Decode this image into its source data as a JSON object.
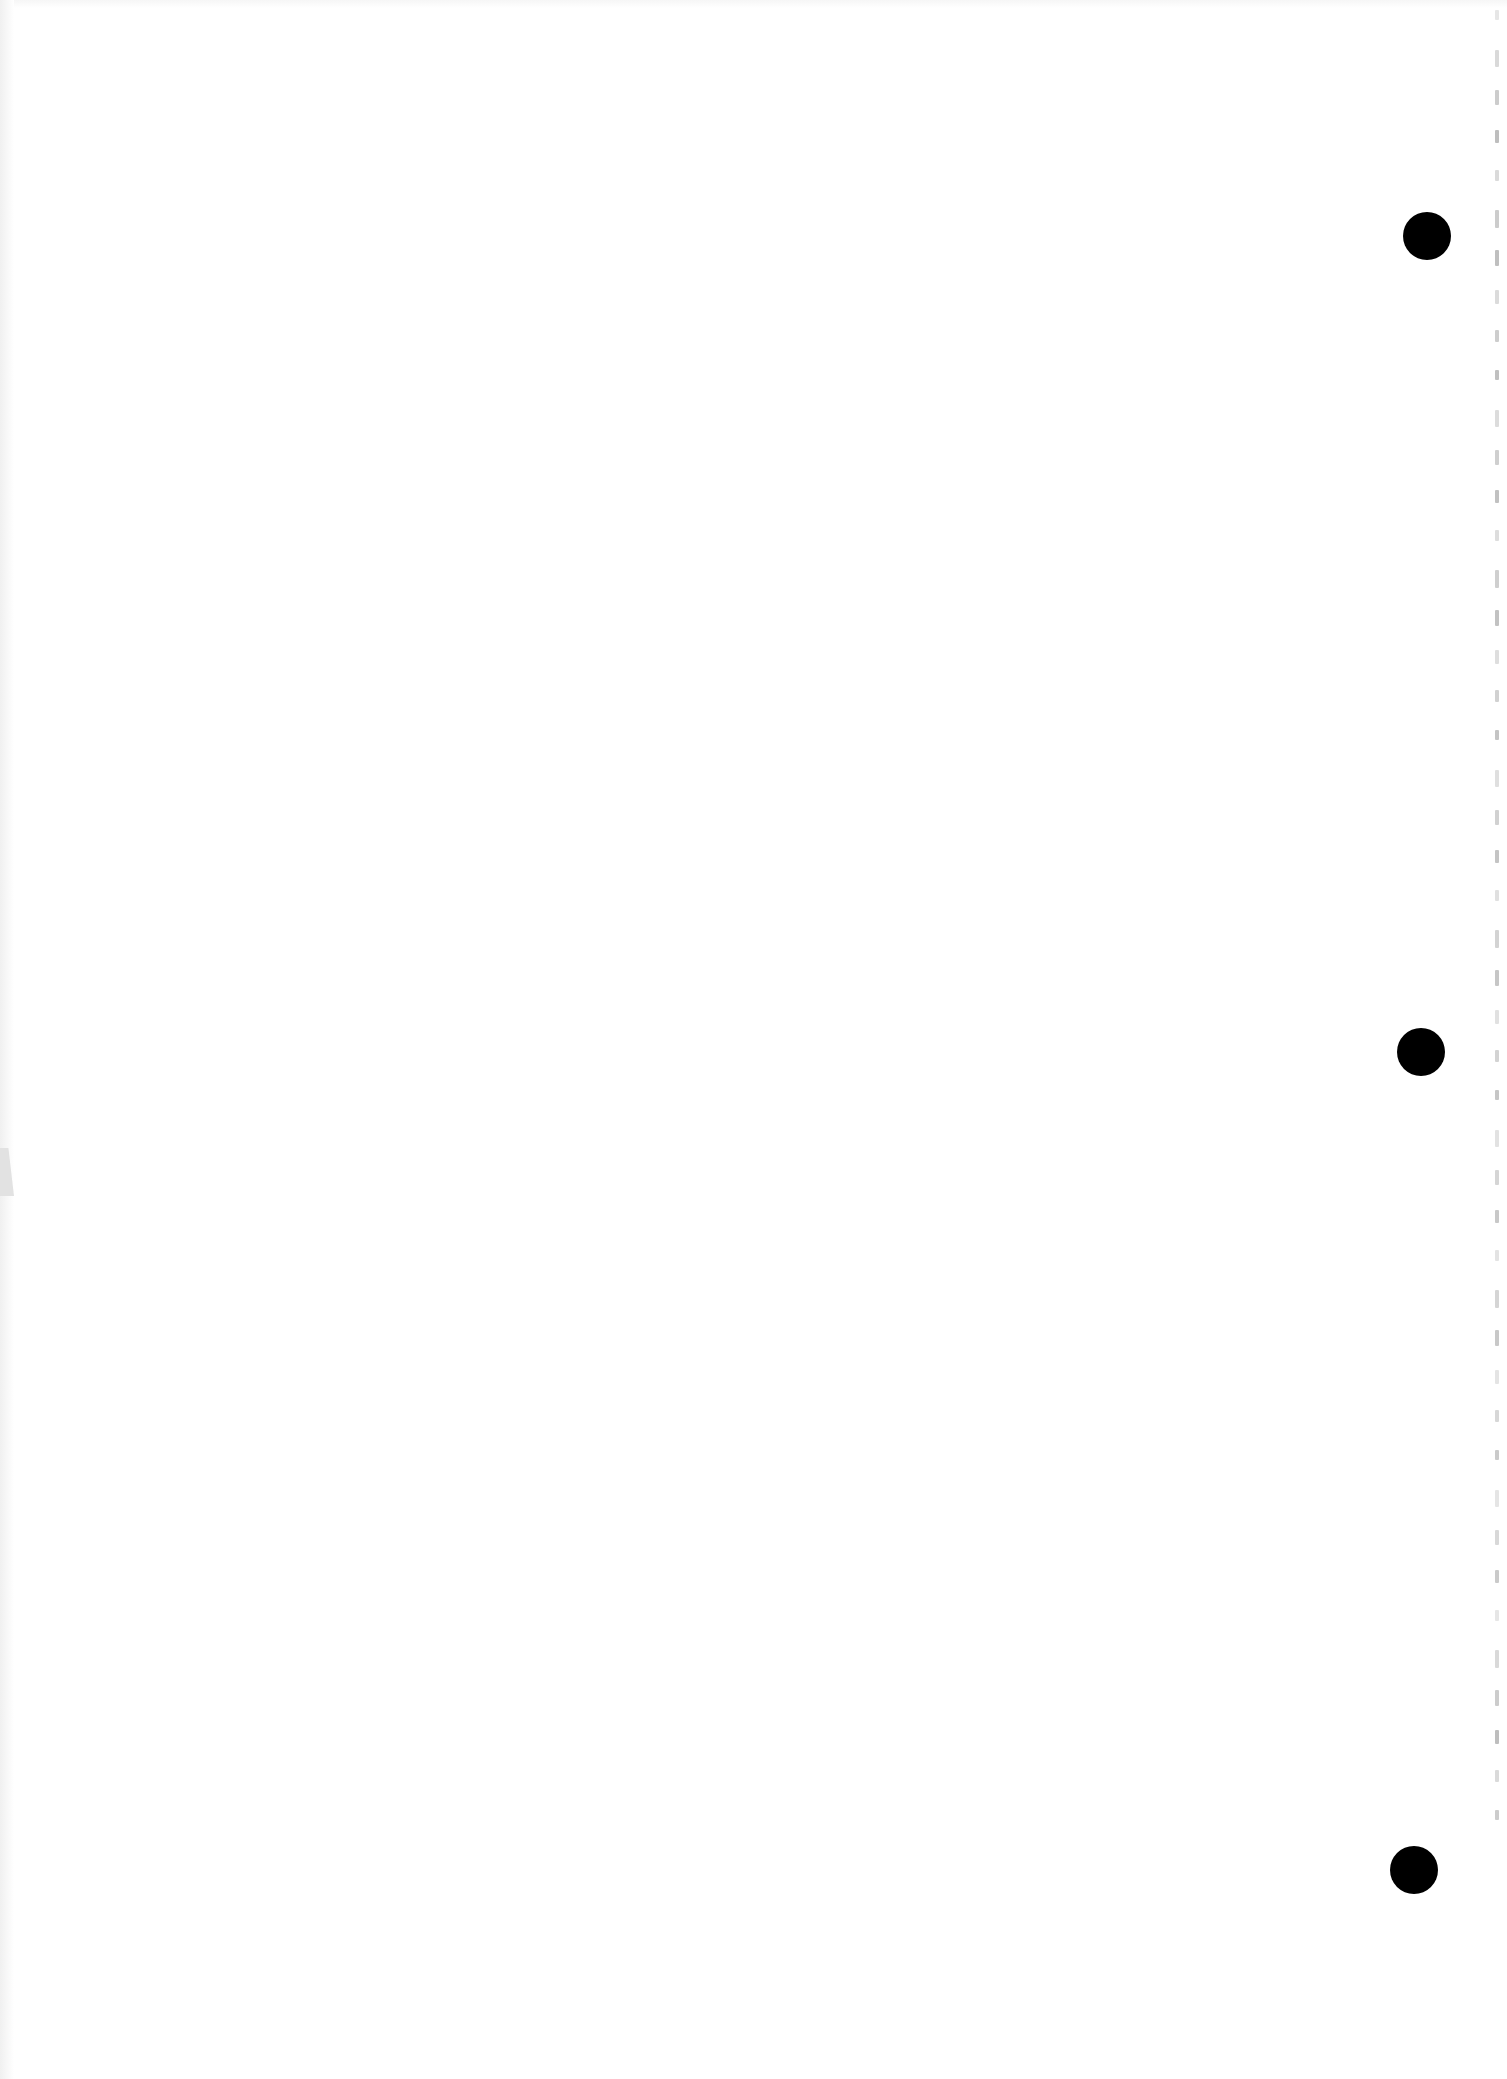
{
  "document": {
    "type": "scanned-blank-page",
    "content_text": "",
    "width": 1507,
    "height": 2079,
    "background_color": "#ffffff"
  },
  "punch_holes": [
    {
      "cx": 1427,
      "cy": 236,
      "d": 48,
      "color": "#000000"
    },
    {
      "cx": 1421,
      "cy": 1052,
      "d": 48,
      "color": "#000000"
    },
    {
      "cx": 1414,
      "cy": 1870,
      "d": 48,
      "color": "#000000"
    }
  ],
  "bleed_through": {
    "x": 1495,
    "color": "#9a9a9a",
    "start_y": 10,
    "end_y": 1830,
    "spacing": 40,
    "legible": false
  }
}
